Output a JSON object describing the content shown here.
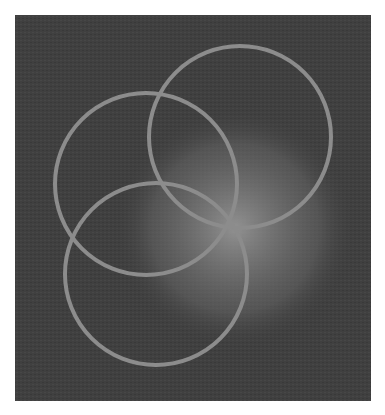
{
  "figure": {
    "background_color": "#404040",
    "panel": {
      "x": 15,
      "y": 15,
      "width": 356,
      "height": 386
    },
    "glow_disc": {
      "cx": 235,
      "cy": 228,
      "r": 92,
      "fill_center": "#ffffff",
      "fill_edge": "#e8e8e8",
      "glow_color": "#bbbbbb"
    },
    "rings": {
      "stroke_color": "#8c8c8c",
      "stroke_width": 4,
      "radius": 91,
      "items": [
        {
          "name": "top",
          "cx": 240,
          "cy": 137
        },
        {
          "name": "upper-left",
          "cx": 146,
          "cy": 184
        },
        {
          "name": "lower-left",
          "cx": 156,
          "cy": 274
        }
      ]
    }
  }
}
